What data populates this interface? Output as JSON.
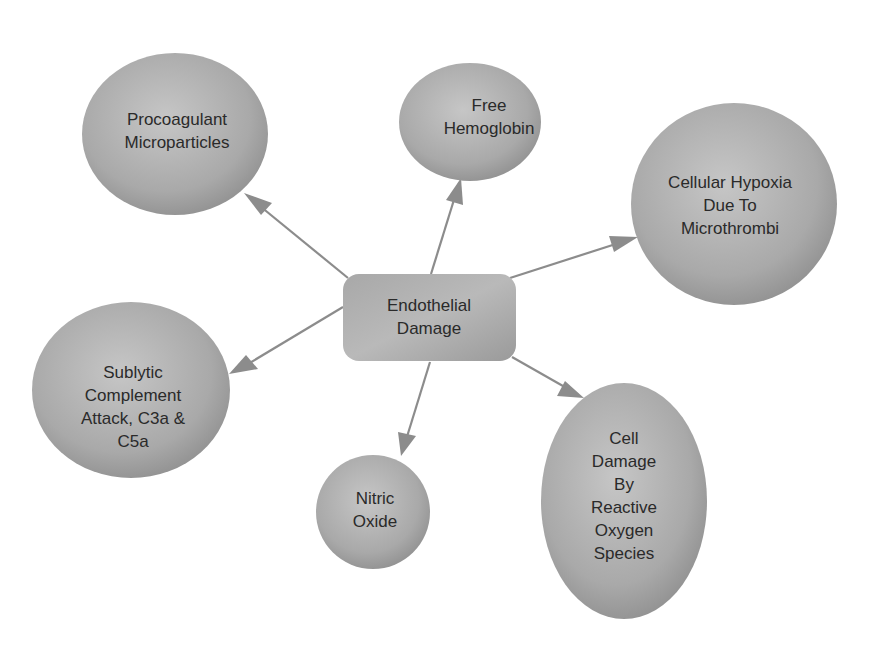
{
  "diagram": {
    "type": "mind-map",
    "colors": {
      "node_fill_light": "#c4c4c4",
      "node_fill_dark": "#8e8e8e",
      "arrow": "#8c8c8c",
      "text": "#2a2a2a",
      "background": "#ffffff"
    },
    "center": {
      "id": "endothelial-damage",
      "lines": [
        "Endothelial",
        "Damage"
      ]
    },
    "nodes": [
      {
        "id": "procoagulant-microparticles",
        "lines": [
          "Procoagulant",
          "Microparticles"
        ]
      },
      {
        "id": "free-hemoglobin",
        "lines": [
          "Free",
          "Hemoglobin"
        ]
      },
      {
        "id": "cellular-hypoxia",
        "lines": [
          "Cellular Hypoxia",
          "Due To",
          "Microthrombi"
        ]
      },
      {
        "id": "sublytic-complement",
        "lines": [
          "Sublytic",
          "Complement",
          "Attack, C3a &",
          "C5a"
        ]
      },
      {
        "id": "nitric-oxide",
        "lines": [
          "Nitric",
          "Oxide"
        ]
      },
      {
        "id": "cell-damage-ros",
        "lines": [
          "Cell",
          "Damage",
          "By",
          "Reactive",
          "Oxygen",
          "Species"
        ]
      }
    ],
    "edges": [
      {
        "from": "endothelial-damage",
        "to": "procoagulant-microparticles"
      },
      {
        "from": "endothelial-damage",
        "to": "free-hemoglobin"
      },
      {
        "from": "endothelial-damage",
        "to": "cellular-hypoxia"
      },
      {
        "from": "endothelial-damage",
        "to": "sublytic-complement"
      },
      {
        "from": "endothelial-damage",
        "to": "nitric-oxide"
      },
      {
        "from": "endothelial-damage",
        "to": "cell-damage-ros"
      }
    ]
  }
}
